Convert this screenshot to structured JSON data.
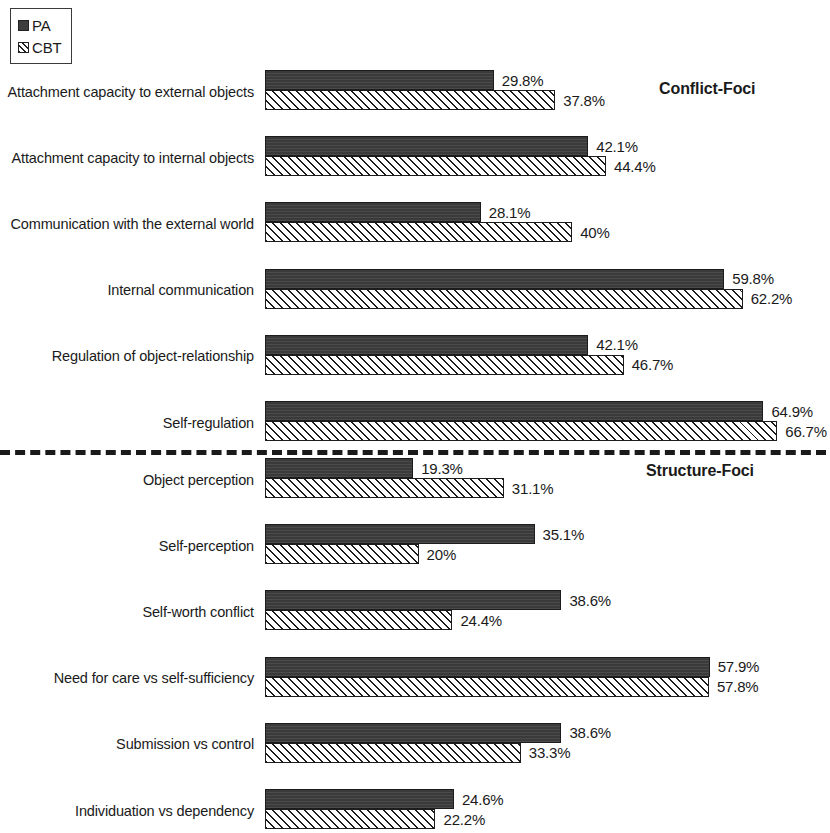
{
  "legend": {
    "items": [
      {
        "key": "pa",
        "label": "PA",
        "swatch": "solid-dark-square-icon"
      },
      {
        "key": "cbt",
        "label": "CBT",
        "swatch": "hatched-square-icon"
      }
    ]
  },
  "groups": {
    "conflict_heading": "Conflict-Foci",
    "structure_heading": "Structure-Foci"
  },
  "divider": {
    "style": "dashed",
    "color": "#1a1a1a"
  },
  "chart_data": {
    "type": "bar",
    "orientation": "horizontal",
    "title": "",
    "subtitle": "",
    "xlabel": "",
    "ylabel": "",
    "xlim": [
      0,
      70
    ],
    "grid": false,
    "legend_position": "top-left",
    "value_format": "percent",
    "group_labels": [
      "Conflict-Foci",
      "Structure-Foci"
    ],
    "categories": [
      "Attachment capacity to external objects",
      "Attachment capacity to internal objects",
      "Communication with the external world",
      "Internal communication",
      "Regulation of object-relationship",
      "Self-regulation",
      "Object perception",
      "Self-perception",
      "Self-worth conflict",
      "Need for care vs self-sufficiency",
      "Submission vs control",
      "Individuation vs dependency"
    ],
    "category_groups": [
      "Conflict-Foci",
      "Conflict-Foci",
      "Conflict-Foci",
      "Conflict-Foci",
      "Conflict-Foci",
      "Conflict-Foci",
      "Structure-Foci",
      "Structure-Foci",
      "Structure-Foci",
      "Structure-Foci",
      "Structure-Foci",
      "Structure-Foci"
    ],
    "series": [
      {
        "name": "PA",
        "values": [
          29.8,
          42.1,
          28.1,
          59.8,
          42.1,
          64.9,
          19.3,
          35.1,
          38.6,
          57.9,
          38.6,
          24.6
        ],
        "labels": [
          "29.8%",
          "42.1%",
          "28.1%",
          "59.8%",
          "42.1%",
          "64.9%",
          "19.3%",
          "35.1%",
          "38.6%",
          "57.9%",
          "38.6%",
          "24.6%"
        ],
        "fill": "#3d3d3d"
      },
      {
        "name": "CBT",
        "values": [
          37.8,
          44.4,
          40,
          62.2,
          46.7,
          66.7,
          31.1,
          20,
          24.4,
          57.8,
          33.3,
          22.2
        ],
        "labels": [
          "37.8%",
          "44.4%",
          "40%",
          "62.2%",
          "46.7%",
          "66.7%",
          "31.1%",
          "20%",
          "24.4%",
          "57.8%",
          "33.3%",
          "22.2%"
        ],
        "fill": "#ffffff",
        "hatch": "forward-diagonal"
      }
    ]
  }
}
